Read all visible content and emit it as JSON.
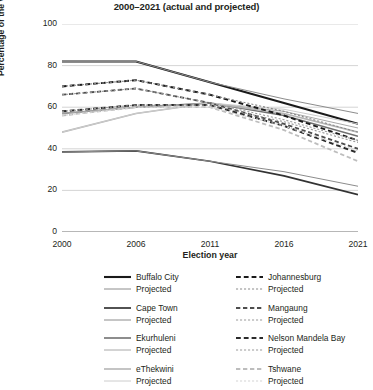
{
  "chart": {
    "title": "2000–2021 (actual and projected)",
    "xlabel": "Election year",
    "ylabel": "Percentage of the vote"
  },
  "axes": {
    "y_ticks": [
      "0",
      "20",
      "40",
      "60",
      "80",
      "100"
    ],
    "x_ticks": [
      "2000",
      "2006",
      "2011",
      "2016",
      "2021"
    ]
  },
  "legend": {
    "projected_label": "Projected",
    "left_column": [
      {
        "name": "Buffalo City",
        "projected": "Projected"
      },
      {
        "name": "Cape Town",
        "projected": "Projected"
      },
      {
        "name": "Ekurhuleni",
        "projected": "Projected"
      },
      {
        "name": "eThekwini",
        "projected": "Projected"
      }
    ],
    "right_column": [
      {
        "name": "Johannesburg",
        "projected": "Projected"
      },
      {
        "name": "Mangaung",
        "projected": "Projected"
      },
      {
        "name": "Nelson Mandela Bay",
        "projected": "Projected"
      },
      {
        "name": "Tshwane",
        "projected": "Projected"
      }
    ]
  },
  "chart_data": {
    "type": "line",
    "title": "2000–2021 (actual and projected)",
    "xlabel": "Election year",
    "ylabel": "Percentage of the vote",
    "x": [
      2000,
      2006,
      2011,
      2016,
      2021
    ],
    "xlim": [
      2000,
      2021
    ],
    "ylim": [
      0,
      100
    ],
    "grid": true,
    "legend_position": "below",
    "series": [
      {
        "name": "Buffalo City",
        "style": "solid",
        "color": "#1a1a1a",
        "width": 2.1,
        "values": [
          82,
          82,
          72,
          62,
          52
        ]
      },
      {
        "name": "Buffalo City Projected",
        "style": "solid",
        "color": "#8c8c8c",
        "width": 1.0,
        "values": [
          82,
          82,
          72,
          64,
          57
        ]
      },
      {
        "name": "Cape Town",
        "style": "solid",
        "color": "#333333",
        "width": 1.7,
        "values": [
          38.5,
          39,
          34,
          27,
          18
        ]
      },
      {
        "name": "Cape Town Projected",
        "style": "solid",
        "color": "#8c8c8c",
        "width": 1.0,
        "values": [
          38.5,
          39,
          34,
          29,
          22
        ]
      },
      {
        "name": "Ekurhuleni",
        "style": "solid",
        "color": "#707070",
        "width": 1.6,
        "values": [
          57,
          60,
          62,
          56,
          46
        ]
      },
      {
        "name": "Ekurhuleni Projected",
        "style": "solid",
        "color": "#a8a8a8",
        "width": 1.0,
        "values": [
          57,
          60,
          62,
          58,
          50
        ]
      },
      {
        "name": "eThekwini",
        "style": "solid",
        "color": "#b5b5b5",
        "width": 1.6,
        "values": [
          48,
          57,
          62,
          57,
          48
        ]
      },
      {
        "name": "eThekwini Projected",
        "style": "solid",
        "color": "#cccccc",
        "width": 1.0,
        "values": [
          48,
          57,
          62,
          59,
          52
        ]
      },
      {
        "name": "Johannesburg",
        "style": "dashed",
        "color": "#1a1a1a",
        "width": 2.0,
        "values": [
          70,
          73,
          66,
          56,
          44
        ]
      },
      {
        "name": "Johannesburg Projected",
        "style": "dotted",
        "color": "#8c8c8c",
        "width": 1.1,
        "values": [
          70,
          73,
          66,
          58,
          48
        ]
      },
      {
        "name": "Mangaung",
        "style": "dashed",
        "color": "#4d4d4d",
        "width": 1.8,
        "values": [
          66,
          69,
          62,
          52,
          40
        ]
      },
      {
        "name": "Mangaung Projected",
        "style": "dotted",
        "color": "#9a9a9a",
        "width": 1.1,
        "values": [
          66,
          69,
          62,
          54,
          44
        ]
      },
      {
        "name": "Nelson Mandela Bay",
        "style": "dashed",
        "color": "#2b2b2b",
        "width": 2.0,
        "values": [
          58,
          61,
          61,
          51,
          38
        ]
      },
      {
        "name": "Nelson Mandela Bay Projected",
        "style": "dotted",
        "color": "#9a9a9a",
        "width": 1.1,
        "values": [
          58,
          61,
          61,
          53,
          43
        ]
      },
      {
        "name": "Tshwane",
        "style": "dashed",
        "color": "#bdbdbd",
        "width": 1.8,
        "values": [
          56,
          60,
          60,
          49,
          34
        ]
      },
      {
        "name": "Tshwane Projected",
        "style": "dotted",
        "color": "#d4d4d4",
        "width": 1.1,
        "values": [
          56,
          60,
          60,
          51,
          39
        ]
      }
    ]
  },
  "colors": {
    "grid": "#c9c9c9",
    "axis": "#6e6e6e",
    "text": "#231f20"
  }
}
